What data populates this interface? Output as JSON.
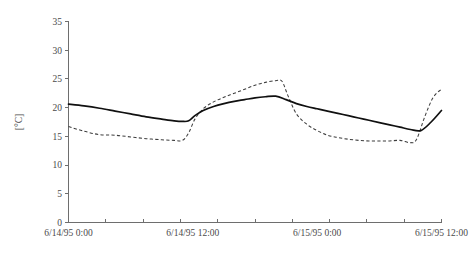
{
  "chart_data": {
    "type": "line",
    "title": "",
    "xlabel": "",
    "ylabel": "[°C]",
    "ylim": [
      0,
      35
    ],
    "yticks": [
      0,
      5,
      10,
      15,
      20,
      25,
      30,
      35
    ],
    "xticks_labeled": [
      "6/14/95 0:00",
      "6/14/95 12:00",
      "6/15/95 0:00",
      "6/15/95 12:00"
    ],
    "xtick_count_minor": 10,
    "grid": false,
    "legend": "none",
    "x_unit": "hours from 6/14/95 0:00",
    "xlim": [
      0,
      36
    ],
    "series": [
      {
        "name": "solid-line",
        "style": "solid",
        "color": "#101010",
        "x": [
          0,
          1.5,
          3,
          4.5,
          6,
          7.5,
          9,
          10.2,
          11,
          11.6,
          12.2,
          13,
          14,
          15,
          16,
          17,
          18,
          19,
          20,
          21,
          22,
          23,
          24,
          25,
          26,
          27,
          28,
          29,
          30,
          31,
          32,
          33,
          34,
          35,
          36
        ],
        "values": [
          20.6,
          20.3,
          19.9,
          19.4,
          18.9,
          18.4,
          18.0,
          17.7,
          17.6,
          17.7,
          18.6,
          19.5,
          20.2,
          20.7,
          21.1,
          21.4,
          21.7,
          21.9,
          22.0,
          21.4,
          20.7,
          20.2,
          19.8,
          19.4,
          19.0,
          18.6,
          18.2,
          17.8,
          17.4,
          17.0,
          16.6,
          16.2,
          16.0,
          17.5,
          19.5
        ]
      },
      {
        "name": "dashed-line",
        "style": "dashed",
        "color": "#3d3d3d",
        "x": [
          0,
          1.5,
          3,
          4.5,
          6,
          7.5,
          9,
          10.2,
          11,
          11.6,
          12.2,
          13,
          14,
          15,
          16,
          17,
          18,
          19,
          20,
          20.6,
          21.2,
          22,
          23,
          24,
          25,
          26,
          27,
          28,
          29,
          30,
          31,
          32,
          33,
          33.6,
          34.4,
          35.2,
          36
        ],
        "values": [
          16.7,
          15.9,
          15.3,
          15.2,
          14.9,
          14.6,
          14.4,
          14.3,
          14.3,
          15.6,
          18.0,
          19.8,
          21.0,
          21.8,
          22.5,
          23.2,
          23.9,
          24.4,
          24.7,
          24.6,
          22.0,
          18.9,
          17.1,
          16.0,
          15.2,
          14.8,
          14.5,
          14.3,
          14.2,
          14.2,
          14.2,
          14.3,
          13.9,
          14.5,
          18.5,
          21.8,
          23.2
        ]
      }
    ]
  },
  "axes": {
    "y_tick_labels": [
      "0",
      "5",
      "10",
      "15",
      "20",
      "25",
      "30",
      "35"
    ],
    "y_axis_title": "[°C]",
    "x_tick_labels": [
      "6/14/95 0:00",
      "6/14/95 12:00",
      "6/15/95 0:00",
      "6/15/95 12:00"
    ]
  }
}
